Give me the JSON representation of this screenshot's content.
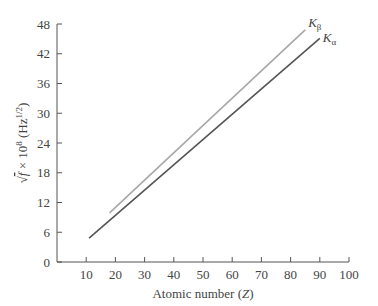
{
  "chart_data": {
    "type": "line",
    "title": "",
    "xlabel": "Atomic number (Z)",
    "ylabel": "√f × 10^8 (Hz^1/2)",
    "xlim": [
      0,
      100
    ],
    "ylim": [
      0,
      48
    ],
    "x_ticks": [
      10,
      20,
      30,
      40,
      50,
      60,
      70,
      80,
      90,
      100
    ],
    "y_ticks": [
      0,
      6,
      12,
      18,
      24,
      30,
      36,
      42,
      48
    ],
    "grid": false,
    "legend": "inline labels at line ends",
    "series": [
      {
        "name": "Kβ",
        "label_main": "K",
        "label_sub": "β",
        "color": "#a8a8a8",
        "x": [
          18,
          85
        ],
        "y": [
          9.9,
          46.8
        ]
      },
      {
        "name": "Kα",
        "label_main": "K",
        "label_sub": "α",
        "color": "#555555",
        "x": [
          11,
          90
        ],
        "y": [
          4.8,
          45.1
        ]
      }
    ]
  },
  "axes": {
    "x_title_main": "Atomic number (",
    "x_title_var": "Z",
    "x_title_end": ")",
    "y_title_root": "√",
    "y_title_var": "f",
    "y_title_mid": " × 10",
    "y_title_exp": "8",
    "y_title_unit": " (Hz",
    "y_title_unit_exp": "1/2",
    "y_title_end": ")"
  }
}
